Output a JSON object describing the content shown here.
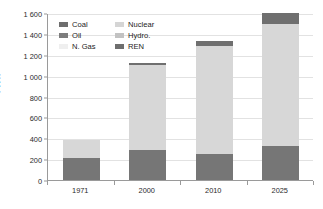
{
  "chart_data": {
    "type": "bar",
    "subtype": "stacked-bar",
    "title": "",
    "xlabel": "",
    "ylabel": "TWh",
    "categories": [
      "1971",
      "2000",
      "2010",
      "2025"
    ],
    "ylim": [
      0,
      1600
    ],
    "ytick_step": 200,
    "ytick_labels": [
      "0",
      "200",
      "400",
      "600",
      "800",
      "1 000",
      "1 200",
      "1 400",
      "1 600"
    ],
    "ytick_values": [
      0,
      200,
      400,
      600,
      800,
      1000,
      1200,
      1400,
      1600
    ],
    "grid": "horizontal",
    "legend_position": "top-left-inside",
    "series": [
      {
        "name": "Coal",
        "color": "#6e6e6e",
        "values": [
          95,
          120,
          110,
          145
        ]
      },
      {
        "name": "Oil",
        "color": "#7d7d7d",
        "values": [
          70,
          90,
          75,
          95
        ]
      },
      {
        "name": "N. Gas",
        "color": "#f0f0f0",
        "values": [
          45,
          75,
          65,
          90
        ]
      },
      {
        "name": "Nuclear",
        "color": "#d5d5d5",
        "values": [
          120,
          700,
          880,
          980
        ]
      },
      {
        "name": "Hydro.",
        "color": "#c2c2c2",
        "values": [
          50,
          120,
          155,
          180
        ]
      },
      {
        "name": "REN",
        "color": "#6e6e6e",
        "values": [
          0,
          15,
          50,
          110
        ]
      }
    ],
    "totals": [
      380,
      1120,
      1335,
      1600
    ],
    "stack_breaks": {
      "1971": {
        "fossil_base_top": 210,
        "mid_top": 380,
        "ren_top": 380
      },
      "2000": {
        "fossil_base_top": 285,
        "mid_top": 1105,
        "ren_top": 1120
      },
      "2010": {
        "fossil_base_top": 250,
        "mid_top": 1285,
        "ren_top": 1335
      },
      "2025": {
        "fossil_base_top": 330,
        "mid_top": 1490,
        "ren_top": 1600
      }
    }
  },
  "legend": {
    "items": [
      {
        "label": "Coal",
        "color": "#6e6e6e"
      },
      {
        "label": "Nuclear",
        "color": "#d5d5d5"
      },
      {
        "label": "Oil",
        "color": "#7d7d7d"
      },
      {
        "label": "Hydro.",
        "color": "#c2c2c2"
      },
      {
        "label": "N. Gas",
        "color": "#efefef"
      },
      {
        "label": "REN",
        "color": "#6e6e6e"
      }
    ]
  },
  "axes": {
    "y_title": "TWh"
  },
  "colors": {
    "axis": "#9a9a9a",
    "grid": "#e2e2e2",
    "text": "#2b2b2b",
    "bar_base": "#767676",
    "bar_mid": "#d7d7d7",
    "bar_top": "#6f6f6f",
    "background": "#ffffff"
  }
}
